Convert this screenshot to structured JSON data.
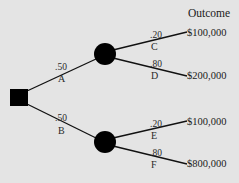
{
  "title": "Outcome",
  "decision_node": {
    "shape": "square",
    "color": "#000000"
  },
  "branches": [
    {
      "prob": ".50",
      "label": "A",
      "chance_node": {
        "shape": "circle",
        "color": "#000000"
      },
      "outcomes": [
        {
          "prob": ".20",
          "label": "C",
          "value": "$100,000"
        },
        {
          "prob": ".80",
          "label": "D",
          "value": "$200,000"
        }
      ]
    },
    {
      "prob": ".50",
      "label": "B",
      "chance_node": {
        "shape": "circle",
        "color": "#000000"
      },
      "outcomes": [
        {
          "prob": ".20",
          "label": "E",
          "value": "$100,000"
        },
        {
          "prob": ".80",
          "label": "F",
          "value": "$800,000"
        }
      ]
    }
  ],
  "colors": {
    "background": "#e4e4e4",
    "ink": "#000000"
  }
}
